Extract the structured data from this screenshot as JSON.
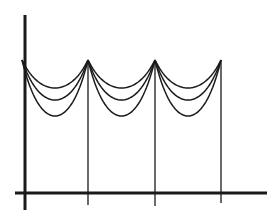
{
  "diagram": {
    "stroke_color": "#1a1a1a",
    "background": "#ffffff",
    "axes": {
      "vertical": {
        "x": 25,
        "y1": 15,
        "y2": 210
      },
      "horizontal": {
        "y": 193,
        "x1": 15,
        "x2": 267
      }
    },
    "posts": [
      {
        "x": 88,
        "top": 60,
        "bottom": 205
      },
      {
        "x": 155,
        "top": 60,
        "bottom": 206
      },
      {
        "x": 221,
        "top": 60,
        "bottom": 203
      }
    ],
    "spans": [
      {
        "x1": 22,
        "x2": 88
      },
      {
        "x1": 88,
        "x2": 155
      },
      {
        "x1": 155,
        "x2": 221
      }
    ],
    "sag_depths": [
      28,
      40,
      56
    ],
    "attach_y": 60
  }
}
